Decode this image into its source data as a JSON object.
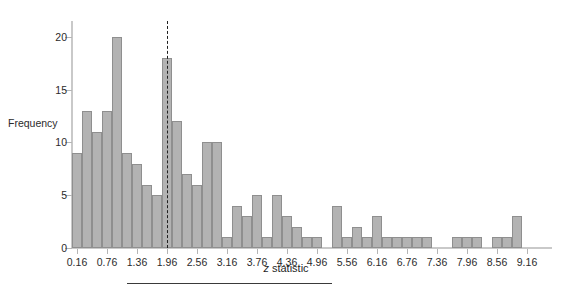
{
  "chart_data": {
    "type": "bar",
    "title": "",
    "subtitle": "",
    "xlabel": "z statistic",
    "xlabel_italic_prefix": "z",
    "xlabel_rest": " statistic",
    "ylabel": "Frequency",
    "bin_width": 0.2,
    "x_start": 0.06,
    "xlim": [
      0.06,
      9.66
    ],
    "ylim": [
      0,
      21.5
    ],
    "yticks": [
      0,
      5,
      10,
      15,
      20
    ],
    "ytick_labels": [
      "0",
      "5",
      "10",
      "15",
      "20"
    ],
    "xticks": [
      0.16,
      0.76,
      1.36,
      1.96,
      2.56,
      3.16,
      3.76,
      4.36,
      4.96,
      5.56,
      6.16,
      6.76,
      7.36,
      7.96,
      8.56,
      9.16
    ],
    "xtick_labels": [
      "0.16",
      "0.76",
      "1.36",
      "1.96",
      "2.56",
      "3.16",
      "3.76",
      "4.36",
      "4.96",
      "5.56",
      "6.16",
      "6.76",
      "7.36",
      "7.96",
      "8.56",
      "9.16"
    ],
    "grid": false,
    "legend": null,
    "bin_centers": [
      0.16,
      0.36,
      0.56,
      0.76,
      0.96,
      1.16,
      1.36,
      1.56,
      1.76,
      1.96,
      2.16,
      2.36,
      2.56,
      2.76,
      2.96,
      3.16,
      3.36,
      3.56,
      3.76,
      3.96,
      4.16,
      4.36,
      4.56,
      4.76,
      4.96,
      5.16,
      5.36,
      5.56,
      5.76,
      5.96,
      6.16,
      6.36,
      6.56,
      6.76,
      6.96,
      7.16,
      7.36,
      7.56,
      7.76,
      7.96,
      8.16,
      8.36,
      8.56,
      8.76,
      8.96,
      9.16
    ],
    "values": [
      9,
      13,
      11,
      13,
      20,
      9,
      8,
      6,
      5,
      18,
      12,
      7,
      6,
      10,
      10,
      1,
      4,
      3,
      5,
      1,
      5,
      3,
      2,
      1,
      1,
      0,
      4,
      1,
      2,
      1,
      3,
      1,
      1,
      1,
      1,
      1,
      0,
      0,
      1,
      1,
      1,
      0,
      1,
      1,
      3,
      0
    ],
    "annotations": [
      {
        "name": "significance-threshold",
        "type": "vline",
        "x": 1.96,
        "style": "dashed",
        "color": "#1f1f1f",
        "y_top": 21.5
      }
    ],
    "bar_color": "#b3b3b3",
    "bar_edge_color": "#8f8f8f"
  }
}
